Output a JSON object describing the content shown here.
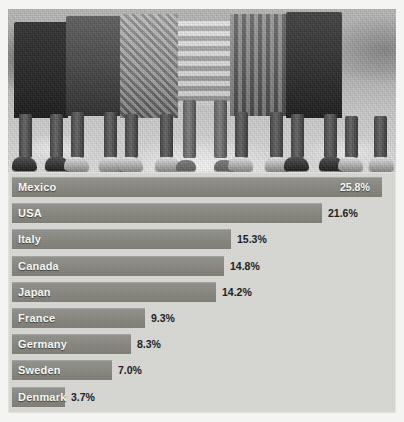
{
  "figure": {
    "photo": {
      "alt_description": "Black and white photograph of children's legs and feet standing in a row on sandy ground",
      "name": "children-legs-photo"
    }
  },
  "chart_data": {
    "type": "bar",
    "orientation": "horizontal",
    "title": "",
    "xlabel": "",
    "ylabel": "",
    "grid": false,
    "legend": null,
    "xlim": [
      0,
      26.5
    ],
    "categories": [
      "Mexico",
      "USA",
      "Italy",
      "Canada",
      "Japan",
      "France",
      "Germany",
      "Sweden",
      "Denmark"
    ],
    "values": [
      25.8,
      21.6,
      15.3,
      14.8,
      14.2,
      9.3,
      8.3,
      7.0,
      3.7
    ],
    "value_labels": [
      "25.8%",
      "21.6%",
      "15.3%",
      "14.8%",
      "14.2%",
      "9.3%",
      "8.3%",
      "7.0%",
      "3.7%"
    ],
    "bars": [
      {
        "label": "Mexico",
        "value": 25.8,
        "value_label": "25.8%",
        "label_placement": "inside",
        "value_placement": "inside"
      },
      {
        "label": "USA",
        "value": 21.6,
        "value_label": "21.6%",
        "label_placement": "inside",
        "value_placement": "outside"
      },
      {
        "label": "Italy",
        "value": 15.3,
        "value_label": "15.3%",
        "label_placement": "inside",
        "value_placement": "outside"
      },
      {
        "label": "Canada",
        "value": 14.8,
        "value_label": "14.8%",
        "label_placement": "inside",
        "value_placement": "outside"
      },
      {
        "label": "Japan",
        "value": 14.2,
        "value_label": "14.2%",
        "label_placement": "inside",
        "value_placement": "outside"
      },
      {
        "label": "France",
        "value": 9.3,
        "value_label": "9.3%",
        "label_placement": "inside",
        "value_placement": "outside"
      },
      {
        "label": "Germany",
        "value": 8.3,
        "value_label": "8.3%",
        "label_placement": "inside",
        "value_placement": "outside"
      },
      {
        "label": "Sweden",
        "value": 7.0,
        "value_label": "7.0%",
        "label_placement": "inside",
        "value_placement": "outside"
      },
      {
        "label": "Denmark",
        "value": 3.7,
        "value_label": "3.7%",
        "label_placement": "inside",
        "value_placement": "outside"
      }
    ],
    "colors": {
      "bar": "#8a8a83",
      "panel_background": "#d7d7d4",
      "page_background": "#f4f4f2",
      "label_text": "#fbfbf9",
      "value_text_outside": "#20201e"
    }
  }
}
